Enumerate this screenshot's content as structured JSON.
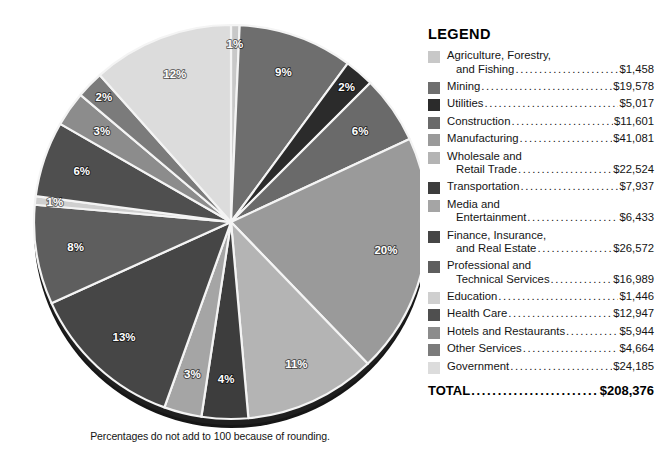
{
  "chart_data": {
    "type": "pie",
    "title": "",
    "footnote": "Percentages do not add to 100 because of rounding.",
    "value_unit": "$ millions",
    "total_label": "TOTAL",
    "total_value": "$208,376",
    "legend_title": "LEGEND",
    "legend_position": "right",
    "start_angle_deg": 0,
    "direction": "clockwise",
    "categories": [
      "Agriculture, Forestry, and Fishing",
      "Mining",
      "Utilities",
      "Construction",
      "Manufacturing",
      "Wholesale and Retail Trade",
      "Transportation",
      "Media and Entertainment",
      "Finance, Insurance, and Real Estate",
      "Professional and Technical Services",
      "Education",
      "Health Care",
      "Hotels and Restaurants",
      "Other Services",
      "Government"
    ],
    "values": [
      1458,
      19578,
      5017,
      11601,
      41081,
      22524,
      7937,
      6433,
      26572,
      16989,
      1446,
      12947,
      5944,
      4664,
      24185
    ],
    "value_labels": [
      "$1,458",
      "$19,578",
      "$5,017",
      "$11,601",
      "$41,081",
      "$22,524",
      "$7,937",
      "$6,433",
      "$26,572",
      "$16,989",
      "$1,446",
      "$12,947",
      "$5,944",
      "$4,664",
      "$24,185"
    ],
    "percent_labels": [
      "1%",
      "9%",
      "2%",
      "6%",
      "20%",
      "11%",
      "4%",
      "3%",
      "13%",
      "8%",
      "1%",
      "6%",
      "3%",
      "2%",
      "12%"
    ],
    "percents": [
      1,
      9,
      2,
      6,
      20,
      11,
      4,
      3,
      13,
      8,
      1,
      6,
      3,
      2,
      12
    ],
    "colors": [
      "#c8c8c8",
      "#6e6e6e",
      "#2b2b2b",
      "#6a6a6a",
      "#9a9a9a",
      "#b4b4b4",
      "#3d3d3d",
      "#a5a5a5",
      "#464646",
      "#5e5e5e",
      "#cfcfcf",
      "#4f4f4f",
      "#8c8c8c",
      "#7b7b7b",
      "#dcdcdc"
    ],
    "label_text_dark": [
      false,
      false,
      false,
      false,
      false,
      false,
      false,
      false,
      false,
      false,
      false,
      false,
      false,
      false,
      false
    ]
  },
  "legend": {
    "title": "LEGEND",
    "rows": [
      {
        "line1": "Agriculture, Forestry,",
        "line2": "and Fishing",
        "value": "$1,458",
        "color": "#c8c8c8"
      },
      {
        "line1": "",
        "line2": "Mining",
        "value": "$19,578",
        "color": "#6e6e6e"
      },
      {
        "line1": "",
        "line2": "Utilities",
        "value": "$5,017",
        "color": "#2b2b2b"
      },
      {
        "line1": "",
        "line2": "Construction",
        "value": "$11,601",
        "color": "#6a6a6a"
      },
      {
        "line1": "",
        "line2": "Manufacturing",
        "value": "$41,081",
        "color": "#9a9a9a"
      },
      {
        "line1": "Wholesale and",
        "line2": "Retail Trade",
        "value": "$22,524",
        "color": "#b4b4b4"
      },
      {
        "line1": "",
        "line2": "Transportation",
        "value": "$7,937",
        "color": "#3d3d3d"
      },
      {
        "line1": "Media and",
        "line2": "Entertainment",
        "value": "$6,433",
        "color": "#a5a5a5"
      },
      {
        "line1": "Finance, Insurance,",
        "line2": "and Real Estate",
        "value": "$26,572",
        "color": "#464646"
      },
      {
        "line1": "Professional and",
        "line2": "Technical Services",
        "value": "$16,989",
        "color": "#5e5e5e"
      },
      {
        "line1": "",
        "line2": "Education",
        "value": "$1,446",
        "color": "#cfcfcf"
      },
      {
        "line1": "",
        "line2": "Health Care",
        "value": "$12,947",
        "color": "#4f4f4f"
      },
      {
        "line1": "",
        "line2": "Hotels and Restaurants",
        "value": "$5,944",
        "color": "#8c8c8c"
      },
      {
        "line1": "",
        "line2": "Other Services",
        "value": "$4,664",
        "color": "#7b7b7b"
      },
      {
        "line1": "",
        "line2": "Government",
        "value": "$24,185",
        "color": "#dcdcdc"
      }
    ],
    "total_label": "TOTAL",
    "total_value": "$208,376"
  },
  "footnote": "Percentages do not add to 100 because of rounding."
}
